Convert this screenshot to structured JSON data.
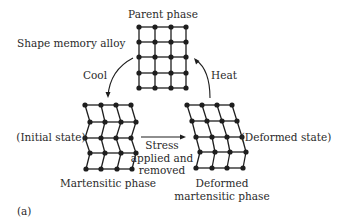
{
  "title": "Shape memory alloy",
  "colors": {
    "ink": "#1e1e1e",
    "text": "#2a2a2a",
    "background": "#ffffff"
  },
  "labels": [
    {
      "id": "title",
      "text": "Shape memory alloy",
      "x": 17,
      "y": 47,
      "anchor": "start"
    },
    {
      "id": "parent-phase",
      "text": "Parent phase",
      "x": 163,
      "y": 18,
      "anchor": "middle"
    },
    {
      "id": "cool",
      "text": "Cool",
      "x": 95,
      "y": 79,
      "anchor": "middle"
    },
    {
      "id": "heat",
      "text": "Heat",
      "x": 224,
      "y": 79,
      "anchor": "middle"
    },
    {
      "id": "initial-state",
      "text": "(Initial state)",
      "x": 51,
      "y": 141,
      "anchor": "middle"
    },
    {
      "id": "deformed-state",
      "text": "(Deformed state)",
      "x": 286,
      "y": 141,
      "anchor": "middle"
    },
    {
      "id": "stress-1",
      "text": "Stress",
      "x": 162,
      "y": 149,
      "anchor": "middle"
    },
    {
      "id": "stress-2",
      "text": "applied and",
      "x": 162,
      "y": 162,
      "anchor": "middle"
    },
    {
      "id": "stress-3",
      "text": "removed",
      "x": 162,
      "y": 174,
      "anchor": "middle"
    },
    {
      "id": "martensitic-phase",
      "text": "Martensitic phase",
      "x": 108,
      "y": 187,
      "anchor": "middle"
    },
    {
      "id": "deformed-martensitic-1",
      "text": "Deformed",
      "x": 222,
      "y": 187,
      "anchor": "middle"
    },
    {
      "id": "deformed-martensitic-2",
      "text": "martensitic phase",
      "x": 222,
      "y": 200,
      "anchor": "middle"
    },
    {
      "id": "panel-label",
      "text": "(a)",
      "x": 17,
      "y": 215,
      "anchor": "start"
    }
  ],
  "lattices": [
    {
      "name": "parent-phase-lattice",
      "rows": [
        [
          [
            139,
            27
          ],
          [
            155,
            27
          ],
          [
            171,
            27
          ],
          [
            186,
            27
          ]
        ],
        [
          [
            139,
            42
          ],
          [
            155,
            42
          ],
          [
            171,
            42
          ],
          [
            186,
            42
          ]
        ],
        [
          [
            139,
            57
          ],
          [
            155,
            57
          ],
          [
            171,
            57
          ],
          [
            186,
            57
          ]
        ],
        [
          [
            139,
            73
          ],
          [
            155,
            73
          ],
          [
            171,
            73
          ],
          [
            186,
            73
          ]
        ],
        [
          [
            139,
            88
          ],
          [
            155,
            88
          ],
          [
            171,
            88
          ],
          [
            186,
            88
          ]
        ]
      ]
    },
    {
      "name": "martensitic-phase-lattice",
      "rows": [
        [
          [
            85,
            105
          ],
          [
            101,
            105
          ],
          [
            116,
            105
          ],
          [
            131,
            105
          ]
        ],
        [
          [
            90,
            122
          ],
          [
            105,
            122
          ],
          [
            121,
            122
          ],
          [
            136,
            122
          ]
        ],
        [
          [
            85,
            138
          ],
          [
            101,
            138
          ],
          [
            116,
            138
          ],
          [
            131,
            138
          ]
        ],
        [
          [
            90,
            153
          ],
          [
            105,
            153
          ],
          [
            121,
            153
          ],
          [
            136,
            153
          ]
        ],
        [
          [
            86,
            169
          ],
          [
            101,
            169
          ],
          [
            117,
            169
          ],
          [
            132,
            169
          ]
        ]
      ]
    },
    {
      "name": "deformed-martensitic-lattice",
      "rows": [
        [
          [
            187,
            105
          ],
          [
            202,
            105
          ],
          [
            217,
            105
          ],
          [
            232,
            105
          ]
        ],
        [
          [
            192,
            121
          ],
          [
            207,
            121
          ],
          [
            222,
            121
          ],
          [
            237,
            121
          ]
        ],
        [
          [
            196,
            137
          ],
          [
            212,
            137
          ],
          [
            227,
            137
          ],
          [
            242,
            137
          ]
        ],
        [
          [
            200,
            152
          ],
          [
            215,
            152
          ],
          [
            230,
            152
          ],
          [
            246,
            152
          ]
        ],
        [
          [
            196,
            168
          ],
          [
            212,
            168
          ],
          [
            227,
            168
          ],
          [
            243,
            168
          ]
        ]
      ]
    }
  ],
  "arrows": [
    {
      "name": "cool-arrow",
      "path": "M133,58 Q110,70 108,96",
      "head": [
        108,
        98
      ],
      "dir": "down"
    },
    {
      "name": "heat-arrow",
      "path": "M210,98 Q210,70 196,60",
      "head": [
        194,
        58
      ],
      "dir": "upleft"
    },
    {
      "name": "stress-arrow",
      "path": "M141,137 L183,137",
      "head": [
        186,
        137
      ],
      "dir": "right"
    }
  ]
}
